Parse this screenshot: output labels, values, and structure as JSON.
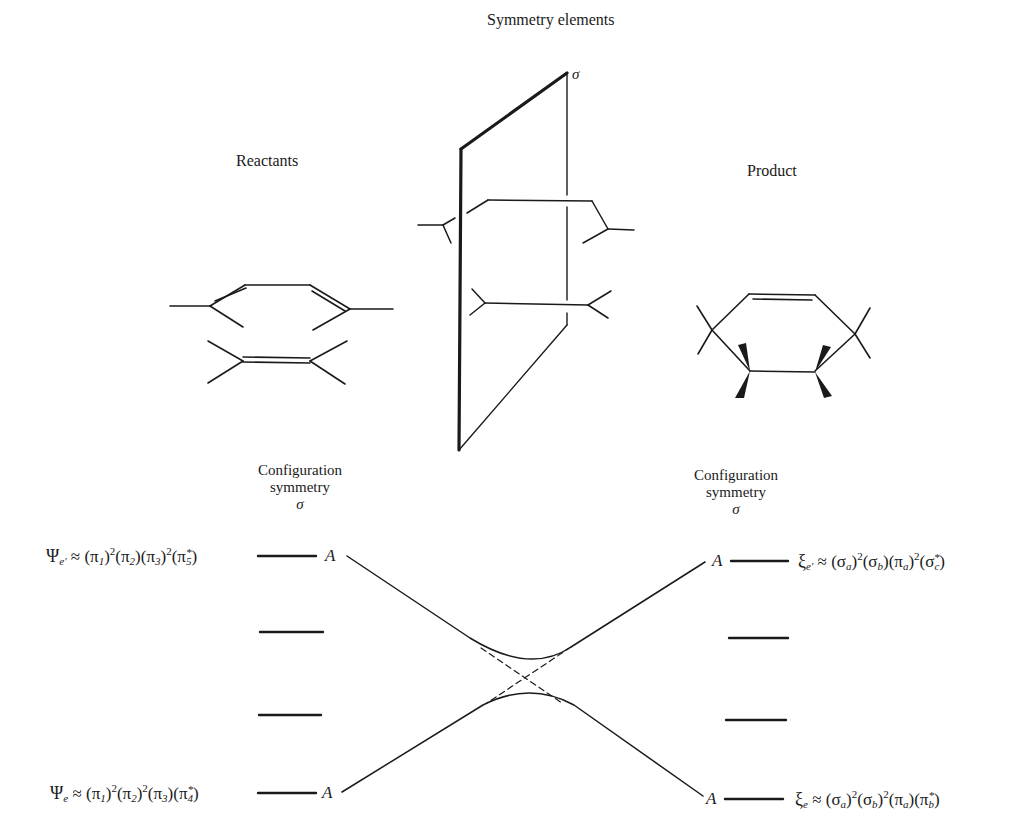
{
  "title": "Symmetry elements",
  "sections": {
    "reactants_label": "Reactants",
    "product_label": "Product",
    "plane_label": "σ"
  },
  "configuration_left": {
    "line1": "Configuration",
    "line2": "symmetry",
    "line3": "σ"
  },
  "configuration_right": {
    "line1": "Configuration",
    "line2": "symmetry",
    "line3": "σ"
  },
  "states": {
    "left_upper": {
      "symbol": "Ψ",
      "subscript": "e′",
      "approx": "≈",
      "terms": [
        {
          "base": "(π",
          "sub": "1",
          "close": ")",
          "sup": "2",
          "star": false
        },
        {
          "base": "(π",
          "sub": "2",
          "close": ")",
          "sup": "",
          "star": false
        },
        {
          "base": "(π",
          "sub": "3",
          "close": ")",
          "sup": "2",
          "star": false
        },
        {
          "base": "(π",
          "sub": "5",
          "close": ")",
          "sup": "",
          "star": true
        }
      ],
      "symmetry": "A"
    },
    "left_lower": {
      "symbol": "Ψ",
      "subscript": "e",
      "approx": "≈",
      "terms": [
        {
          "base": "(π",
          "sub": "1",
          "close": ")",
          "sup": "2",
          "star": false
        },
        {
          "base": "(π",
          "sub": "2",
          "close": ")",
          "sup": "2",
          "star": false
        },
        {
          "base": "(π",
          "sub": "3",
          "close": ")",
          "sup": "",
          "star": false
        },
        {
          "base": "(π",
          "sub": "4",
          "close": ")",
          "sup": "",
          "star": true
        }
      ],
      "symmetry": "A"
    },
    "right_upper": {
      "symbol": "ξ",
      "subscript": "e′",
      "approx": "≈",
      "terms": [
        {
          "base": "(σ",
          "sub": "a",
          "close": ")",
          "sup": "2",
          "star": false
        },
        {
          "base": "(σ",
          "sub": "b",
          "close": ")",
          "sup": "",
          "star": false
        },
        {
          "base": "(π",
          "sub": "a",
          "close": ")",
          "sup": "2",
          "star": false
        },
        {
          "base": "(σ",
          "sub": "c",
          "close": ")",
          "sup": "",
          "star": true
        }
      ],
      "symmetry": "A"
    },
    "right_lower": {
      "symbol": "ξ",
      "subscript": "e",
      "approx": "≈",
      "terms": [
        {
          "base": "(σ",
          "sub": "a",
          "close": ")",
          "sup": "2",
          "star": false
        },
        {
          "base": "(σ",
          "sub": "b",
          "close": ")",
          "sup": "2",
          "star": false
        },
        {
          "base": "(π",
          "sub": "a",
          "close": ")",
          "sup": "",
          "star": false
        },
        {
          "base": "(π",
          "sub": "b",
          "close": ")",
          "sup": "",
          "star": true
        }
      ],
      "symmetry": "A"
    }
  },
  "colors": {
    "ink": "#1a1a1a",
    "background": "#ffffff"
  }
}
